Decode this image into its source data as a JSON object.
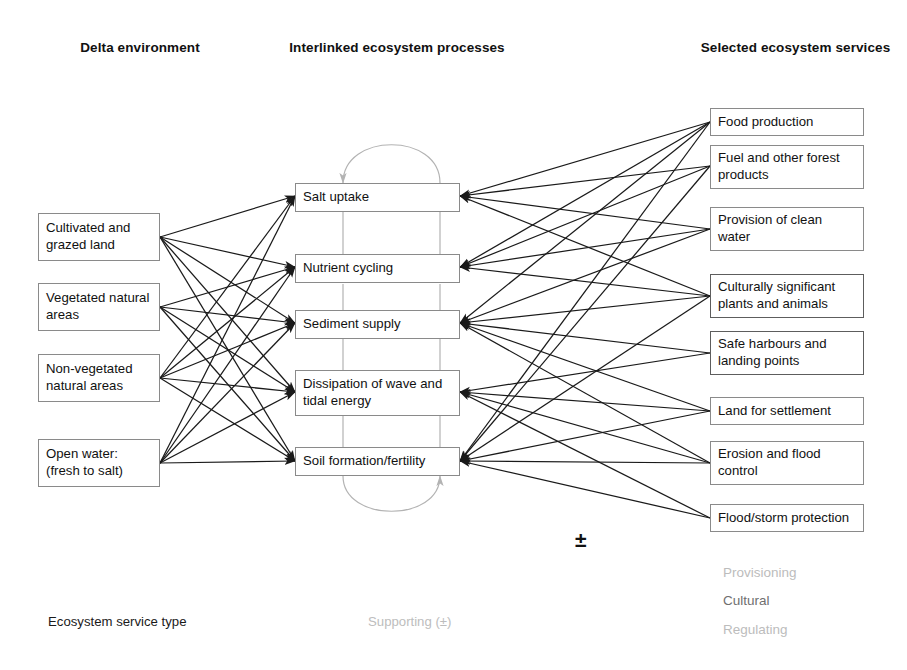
{
  "headers": {
    "left": "Delta environment",
    "middle": "Interlinked ecosystem processes",
    "right": "Selected ecosystem services"
  },
  "colors": {
    "link_black": "#1a1a1a",
    "supporting_gray": "#b3b3b3",
    "box_border": "#8a8a8a",
    "box_border_dark": "#5d5d5d",
    "legend_gray": "#bcbcbc",
    "legend_cultural": "#6f6f6f"
  },
  "environment": {
    "items": [
      {
        "id": "cultivated",
        "label": "Cultivated and grazed land"
      },
      {
        "id": "vegetated",
        "label": "Vegetated natural areas"
      },
      {
        "id": "nonvegetated",
        "label": "Non-vegetated natural areas"
      },
      {
        "id": "openwater",
        "label": "Open water: (fresh to salt)"
      }
    ]
  },
  "processes": {
    "items": [
      {
        "id": "salt",
        "label": "Salt uptake"
      },
      {
        "id": "nutrient",
        "label": "Nutrient cycling"
      },
      {
        "id": "sediment",
        "label": "Sediment supply"
      },
      {
        "id": "dissipation",
        "label": "Dissipation of wave and tidal energy"
      },
      {
        "id": "soil",
        "label": "Soil formation/fertility"
      }
    ]
  },
  "services": {
    "items": [
      {
        "id": "food",
        "label": "Food production",
        "type": "provisioning"
      },
      {
        "id": "fuel",
        "label": "Fuel and other forest products",
        "type": "provisioning"
      },
      {
        "id": "cleanwater",
        "label": "Provision of clean water",
        "type": "provisioning"
      },
      {
        "id": "culturally",
        "label": "Culturally significant plants and animals",
        "type": "cultural"
      },
      {
        "id": "harbours",
        "label": "Safe harbours and landing points",
        "type": "cultural"
      },
      {
        "id": "land",
        "label": "Land for settlement",
        "type": "regulating"
      },
      {
        "id": "erosion",
        "label": "Erosion and flood control",
        "type": "regulating"
      },
      {
        "id": "floodstorm",
        "label": "Flood/storm protection",
        "type": "regulating"
      }
    ]
  },
  "legend": {
    "service_type": "Ecosystem service type",
    "supporting": "Supporting (±)",
    "plus_minus": "±",
    "provisioning": "Provisioning",
    "cultural": "Cultural",
    "regulating": "Regulating"
  }
}
